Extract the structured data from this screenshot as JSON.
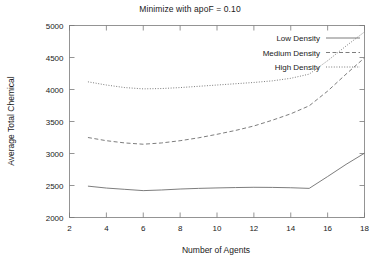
{
  "chart_data": {
    "type": "line",
    "title": "Minimize with apoF = 0.10",
    "xlabel": "Number of Agents",
    "ylabel": "Average Total Chemical",
    "xlim": [
      2,
      18
    ],
    "ylim": [
      2000,
      5000
    ],
    "xticks": [
      "2",
      "4",
      "6",
      "8",
      "10",
      "12",
      "14",
      "16",
      "18"
    ],
    "yticks": [
      "2000",
      "2500",
      "3000",
      "3500",
      "4000",
      "4500",
      "5000"
    ],
    "grid": false,
    "legend_position": "top-right-inside",
    "x": [
      3,
      4,
      5,
      6,
      7,
      8,
      9,
      10,
      11,
      12,
      13,
      14,
      15,
      16,
      17,
      18
    ],
    "series": [
      {
        "name": "Low Density",
        "style": "solid",
        "values": [
          2490,
          2460,
          2440,
          2420,
          2430,
          2445,
          2455,
          2462,
          2468,
          2472,
          2470,
          2465,
          2455,
          2640,
          2830,
          3005
        ]
      },
      {
        "name": "Medium Density",
        "style": "dashed",
        "values": [
          3250,
          3200,
          3165,
          3145,
          3165,
          3200,
          3245,
          3300,
          3360,
          3430,
          3520,
          3620,
          3745,
          3975,
          4240,
          4495
        ]
      },
      {
        "name": "High Density",
        "style": "dotted",
        "values": [
          4120,
          4070,
          4030,
          4010,
          4015,
          4030,
          4050,
          4070,
          4090,
          4110,
          4135,
          4175,
          4240,
          4450,
          4680,
          4900
        ]
      }
    ]
  },
  "legend": {
    "entries": [
      {
        "label": "Low Density"
      },
      {
        "label": "Medium Density"
      },
      {
        "label": "High Density"
      }
    ]
  },
  "colors": {
    "line": "#6e6e6e",
    "axis": "#7a7a7a",
    "text": "#1a1a1a",
    "background": "#ffffff"
  }
}
